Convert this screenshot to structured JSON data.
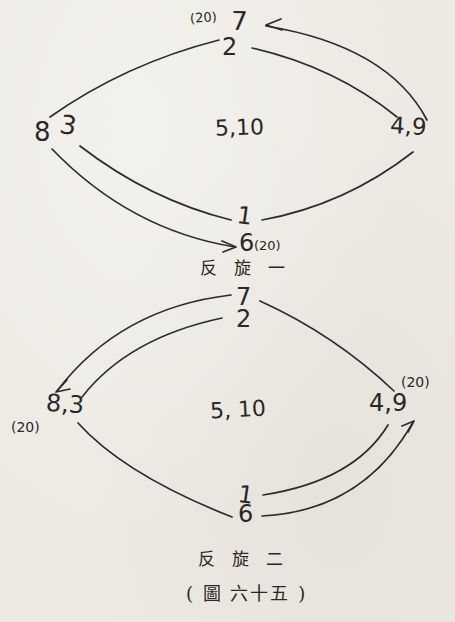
{
  "page": {
    "paper_color": "#edeae3",
    "ink_color": "#2e2c28"
  },
  "diagram1": {
    "caption": "反旋一",
    "nodes": {
      "top_count": "(20)",
      "top_outer": "7",
      "top_inner": "2",
      "left_outer": "8",
      "left_inner": "3",
      "center": "5,10",
      "right": "4,9",
      "bottom_inner": "1",
      "bottom_outer": "6",
      "bottom_count": "(20)"
    },
    "arrows": [
      {
        "at": "7",
        "direction": "left"
      },
      {
        "at": "6",
        "direction": "right"
      }
    ]
  },
  "diagram2": {
    "caption": "反旋二",
    "nodes": {
      "top_outer": "7",
      "top_inner": "2",
      "left": "8,3",
      "left_count": "(20)",
      "center": "5, 10",
      "right": "4,9",
      "right_count": "(20)",
      "bottom_inner": "1",
      "bottom_outer": "6"
    },
    "arrows": [
      {
        "at": "8,3",
        "direction": "down-left"
      },
      {
        "at": "4,9",
        "direction": "up-right"
      }
    ]
  },
  "figure": {
    "caption": "( 圖  六十五 )"
  }
}
